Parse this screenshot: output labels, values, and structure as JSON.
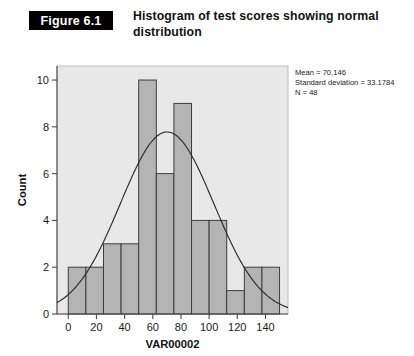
{
  "figure": {
    "badge_label": "Figure 6.1",
    "caption": "Histogram of test scores showing normal distribution"
  },
  "chart_data": {
    "type": "bar",
    "title": "Histogram of test scores showing normal distribution",
    "xlabel": "VAR00002",
    "ylabel": "Count",
    "xlim": [
      -8,
      156
    ],
    "ylim": [
      0,
      10.6
    ],
    "xticks": [
      0,
      20,
      40,
      60,
      80,
      100,
      120,
      140
    ],
    "yticks": [
      0,
      2,
      4,
      6,
      8,
      10
    ],
    "grid": false,
    "legend": "none",
    "bin_width": 12.5,
    "bin_edges": [
      0,
      12.5,
      25,
      37.5,
      50,
      62.5,
      75,
      87.5,
      100,
      112.5,
      125,
      137.5,
      150
    ],
    "categories": [
      "0-12.5",
      "12.5-25",
      "25-37.5",
      "37.5-50",
      "50-62.5",
      "62.5-75",
      "75-87.5",
      "87.5-100",
      "100-112.5",
      "112.5-125",
      "125-137.5",
      "137.5-150"
    ],
    "values": [
      2,
      2,
      3,
      3,
      10,
      6,
      9,
      4,
      4,
      1,
      2,
      2
    ],
    "overlay": {
      "type": "normal-curve",
      "mean": 70.146,
      "std": 33.1784,
      "n": 48,
      "peak_y": 7.78
    },
    "annotations": {
      "mean_line": "Mean = 70.146",
      "sd_line": "Standard deviation = 33.1784",
      "n_line": "N = 48"
    }
  },
  "stats_box": {
    "mean": "Mean = 70.146",
    "standard_deviation": "Standard deviation = 33.1784",
    "n": "N = 48"
  },
  "axes": {
    "x_title": "VAR00002",
    "y_title": "Count",
    "x_tick_labels": [
      "0",
      "20",
      "40",
      "60",
      "80",
      "100",
      "120",
      "140"
    ],
    "y_tick_labels": [
      "0",
      "2",
      "4",
      "6",
      "8",
      "10"
    ]
  },
  "colors": {
    "bar_fill": "#b4b4b4",
    "bar_stroke": "#3d3d3d",
    "plot_background": "#e8e8e8",
    "curve": "#2b2b2b",
    "badge_background": "#000000",
    "badge_text": "#ffffff"
  }
}
